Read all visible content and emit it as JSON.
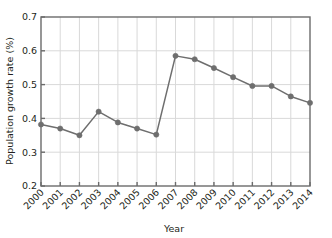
{
  "chart_data": {
    "type": "line",
    "title": "",
    "xlabel": "Year",
    "ylabel": "Population growth rate (%)",
    "categories": [
      "2000",
      "2001",
      "2002",
      "2003",
      "2004",
      "2005",
      "2006",
      "2007",
      "2008",
      "2009",
      "2010",
      "2011",
      "2012",
      "2013",
      "2014"
    ],
    "values": [
      0.382,
      0.37,
      0.35,
      0.42,
      0.388,
      0.37,
      0.352,
      0.585,
      0.575,
      0.549,
      0.522,
      0.496,
      0.496,
      0.465,
      0.446
    ],
    "series": [
      {
        "name": "Population growth rate",
        "values": [
          0.382,
          0.37,
          0.35,
          0.42,
          0.388,
          0.37,
          0.352,
          0.585,
          0.575,
          0.549,
          0.522,
          0.496,
          0.496,
          0.465,
          0.446
        ]
      }
    ],
    "ylim": [
      0.2,
      0.7
    ],
    "yticks": [
      0.2,
      0.3,
      0.4,
      0.5,
      0.6,
      0.7
    ],
    "ytick_labels": [
      "0.2",
      "0.3",
      "0.4",
      "0.5",
      "0.6",
      "0.7"
    ],
    "xtick_labels": [
      "2000",
      "2001",
      "2002",
      "2003",
      "2004",
      "2005",
      "2006",
      "2007",
      "2008",
      "2009",
      "2010",
      "2011",
      "2012",
      "2013",
      "2014"
    ],
    "grid": true,
    "legend": "none",
    "marker": "circle",
    "colors": {
      "line": "#6e6e6e",
      "marker": "#6e6e6e",
      "grid": "#d9d9d9",
      "axis": "#6b6b6b",
      "text": "#231f20",
      "background": "#ffffff"
    }
  }
}
